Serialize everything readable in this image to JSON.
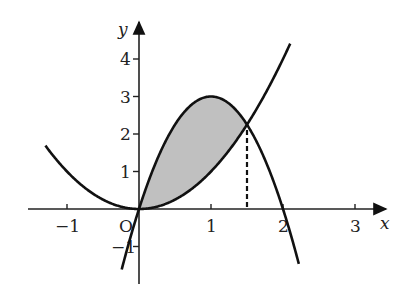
{
  "figure": {
    "axes": {
      "x_label": "x",
      "y_label": "y",
      "origin_label": "O",
      "x_ticks": [
        {
          "v": -1,
          "label": "−1"
        },
        {
          "v": 1,
          "label": "1"
        },
        {
          "v": 2,
          "label": "2"
        },
        {
          "v": 3,
          "label": "3"
        }
      ],
      "y_ticks": [
        {
          "v": -1,
          "label": "−1"
        },
        {
          "v": 1,
          "label": "1"
        },
        {
          "v": 2,
          "label": "2"
        },
        {
          "v": 3,
          "label": "3"
        },
        {
          "v": 4,
          "label": "4"
        }
      ]
    },
    "curves": [
      {
        "name": "parabola-up",
        "equation": "y = x^2",
        "x_range": [
          -1.3,
          2.1
        ]
      },
      {
        "name": "parabola-down",
        "equation": "y = 6x - 3x^2",
        "x_range": [
          -0.24,
          2.22
        ]
      }
    ],
    "shaded_region": {
      "between": [
        "y = 6x - 3x^2",
        "y = x^2"
      ],
      "x_range": [
        0,
        1.5
      ],
      "color": "#c0c0c0"
    },
    "dashed_line": {
      "x": 1.5,
      "from_y": 0,
      "to_y": 2.25
    },
    "intersection": {
      "x": 1.5,
      "y": 2.25
    }
  }
}
